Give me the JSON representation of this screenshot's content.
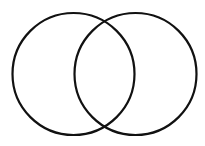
{
  "diagram": {
    "type": "venn",
    "background": "#ffffff",
    "stroke_color": "#111111",
    "stroke_width": 2.2,
    "circles": [
      {
        "name": "left-circle",
        "cx": 73.5,
        "cy": 74,
        "r": 61
      },
      {
        "name": "right-circle",
        "cx": 135.5,
        "cy": 74,
        "r": 61
      }
    ]
  }
}
